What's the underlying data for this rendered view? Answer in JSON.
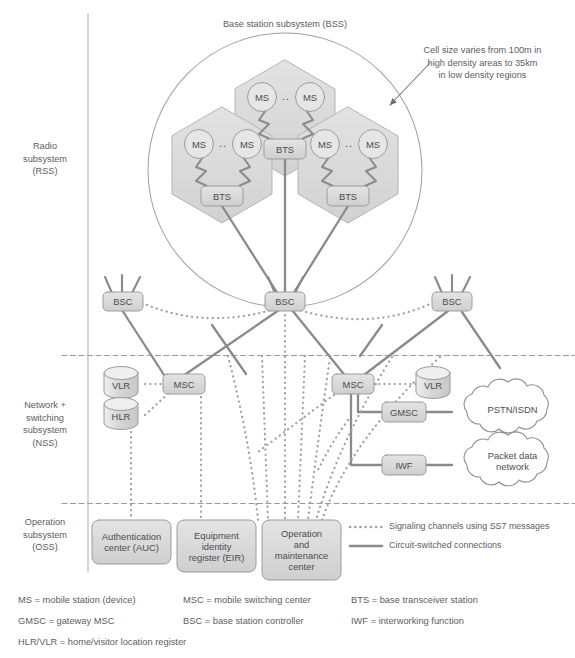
{
  "diagram": {
    "title_bss": "Base station subsystem (BSS)",
    "annotation_cell_size": "Cell size varies from 100m in\nhigh density areas to 35km\nin low density regions"
  },
  "sidebar": {
    "sections": [
      {
        "id": "rss",
        "label": "Radio\nsubsystem\n(RSS)"
      },
      {
        "id": "nss",
        "label": "Network +\nswitching\nsubsystem\n(NSS)"
      },
      {
        "id": "oss",
        "label": "Operation\nsubsystem\n(OSS)"
      }
    ]
  },
  "nodes": {
    "ms": [
      "MS",
      "MS",
      "MS",
      "MS",
      "MS",
      "MS"
    ],
    "ms_ellipsis": "..",
    "bts": [
      "BTS",
      "BTS",
      "BTS"
    ],
    "bsc": [
      "BSC",
      "BSC",
      "BSC"
    ],
    "msc": [
      "MSC",
      "MSC"
    ],
    "vlr": [
      "VLR",
      "VLR"
    ],
    "hlr": "HLR",
    "gmsc": "GMSC",
    "iwf": "IWF",
    "clouds": [
      "PSTN/ISDN",
      "Packet data\nnetwork"
    ],
    "oss_boxes": [
      "Authentication\ncenter (AUC)",
      "Equipment\nidentity\nregister (EIR)",
      "Operation\nand\nmaintenance\ncenter"
    ]
  },
  "legend": {
    "items": [
      {
        "style": "dotted",
        "label": "Signaling channels using SS7 messages"
      },
      {
        "style": "solid",
        "label": "Circuit-switched connections"
      }
    ]
  },
  "footnotes": {
    "col1": [
      "MS = mobile station (device)",
      "GMSC = gateway MSC",
      "HLR/VLR = home/visitor location register"
    ],
    "col2": [
      "MSC = mobile switching center",
      "BSC = base station controller"
    ],
    "col3": [
      "BTS = base transceiver station",
      "IWF = interworking function"
    ]
  },
  "colors": {
    "line": "#8a8a8c",
    "fill_box": "#d9d9d9",
    "fill_hex": "#dcdcdc",
    "text": "#5d5d5f",
    "divider": "#9a9a9c"
  }
}
